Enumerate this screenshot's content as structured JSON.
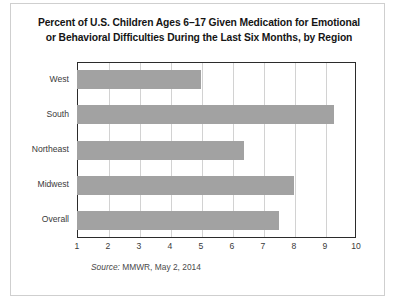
{
  "figure": {
    "title_line1": "Percent of U.S. Children Ages 6–17 Given Medication for Emotional",
    "title_line2": "or Behavioral Difficulties During the Last Six Months, by Region",
    "source_keyword": "Source:",
    "source_text": " MMWR, May 2, 2014",
    "bar_color": "#a2a2a2",
    "grid_color": "#d2d2d2",
    "axis_color": "#2b2b2b"
  },
  "chart_data": {
    "type": "bar",
    "orientation": "horizontal",
    "title": "Percent of U.S. Children Ages 6–17 Given Medication for Emotional or Behavioral Difficulties During the Last Six Months, by Region",
    "categories": [
      "West",
      "South",
      "Northeast",
      "Midwest",
      "Overall"
    ],
    "values": [
      5.0,
      9.3,
      6.4,
      8.0,
      7.5
    ],
    "xlabel": "",
    "ylabel": "",
    "xlim": [
      1,
      10
    ],
    "xticks": [
      1,
      2,
      3,
      4,
      5,
      6,
      7,
      8,
      9,
      10
    ],
    "xtick_labels": [
      "1",
      "2",
      "3",
      "4",
      "5",
      "6",
      "7",
      "8",
      "9",
      "10"
    ],
    "grid": "vertical",
    "legend": "none",
    "source": "Source: MMWR, May 2, 2014"
  }
}
